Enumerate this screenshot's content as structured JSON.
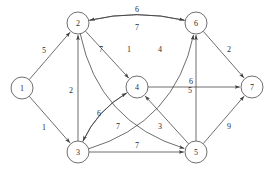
{
  "figure": {
    "type": "directed-weighted-graph",
    "background_color": "#ffffff",
    "edge_color": "#3d3d42",
    "node_fill": "#ffffff",
    "node_stroke": "#4a4a4f",
    "text_color": "#2b2b30",
    "node_radius": 11
  },
  "chart_data": {
    "type": "diagram",
    "title": "",
    "directed": true,
    "weighted": true,
    "nodes": [
      {
        "id": "1",
        "label": "1",
        "x": 22,
        "y": 88
      },
      {
        "id": "2",
        "label": "2",
        "x": 78,
        "y": 23
      },
      {
        "id": "3",
        "label": "3",
        "x": 78,
        "y": 152
      },
      {
        "id": "4",
        "label": "4",
        "x": 137,
        "y": 87
      },
      {
        "id": "5",
        "label": "5",
        "x": 196,
        "y": 152
      },
      {
        "id": "6",
        "label": "6",
        "x": 196,
        "y": 23
      },
      {
        "id": "7",
        "label": "7",
        "x": 252,
        "y": 87
      }
    ],
    "edges": [
      {
        "from": "1",
        "to": "2",
        "weight": "5",
        "shape": "straight",
        "label_x": 44,
        "label_y": 50
      },
      {
        "from": "1",
        "to": "3",
        "weight": "1",
        "shape": "straight",
        "label_x": 44,
        "label_y": 127
      },
      {
        "from": "3",
        "to": "2",
        "weight": "2",
        "shape": "straight",
        "label_x": 71,
        "label_y": 90
      },
      {
        "from": "2",
        "to": "6",
        "weight": "6",
        "shape": "curve-up",
        "label_x": 137,
        "label_y": 9
      },
      {
        "from": "6",
        "to": "2",
        "weight": "7",
        "shape": "curve-down",
        "label_x": 137,
        "label_y": 27
      },
      {
        "from": "2",
        "to": "4",
        "weight": "7",
        "shape": "straight",
        "label_x": 101,
        "label_y": 49
      },
      {
        "from": "2",
        "to": "5",
        "weight": "1",
        "shape": "curve-right",
        "label_x": 129,
        "label_y": 49
      },
      {
        "from": "3",
        "to": "6",
        "weight": "4",
        "shape": "curve-right",
        "label_x": 160,
        "label_y": 49
      },
      {
        "from": "3",
        "to": "4",
        "weight": "6",
        "shape": "curve-up",
        "label_x": 99,
        "label_y": 113
      },
      {
        "from": "4",
        "to": "3",
        "weight": "7",
        "shape": "curve-down",
        "label_x": 118,
        "label_y": 126
      },
      {
        "from": "3",
        "to": "5",
        "weight": "7",
        "shape": "straight",
        "label_x": 137,
        "label_y": 145
      },
      {
        "from": "5",
        "to": "4",
        "weight": "3",
        "shape": "straight",
        "label_x": 160,
        "label_y": 126
      },
      {
        "from": "4",
        "to": "7",
        "weight": "6",
        "shape": "straight",
        "label_x": 191,
        "label_y": 81
      },
      {
        "from": "5",
        "to": "6",
        "weight": "5",
        "shape": "straight",
        "label_x": 190,
        "label_y": 90
      },
      {
        "from": "6",
        "to": "7",
        "weight": "2",
        "shape": "straight",
        "label_x": 229,
        "label_y": 49
      },
      {
        "from": "5",
        "to": "7",
        "weight": "9",
        "shape": "straight",
        "label_x": 229,
        "label_y": 126
      }
    ]
  }
}
